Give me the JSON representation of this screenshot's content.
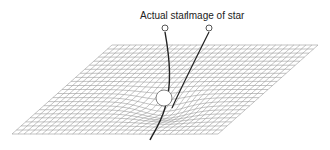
{
  "diagram": {
    "labels": {
      "actual_star": "Actual star",
      "image_of_star": "Image of star"
    },
    "grid": {
      "corners": {
        "tl": [
          112,
          45
        ],
        "tr": [
          318,
          45
        ],
        "br": [
          218,
          134
        ],
        "bl": [
          12,
          134
        ]
      },
      "cols": 34,
      "rows": 22,
      "line_color": "#9a9a9a"
    },
    "mass": {
      "cx": 164,
      "cy": 98,
      "r": 8
    },
    "actual_star": {
      "cx": 165,
      "cy": 28
    },
    "image_star": {
      "cx": 209,
      "cy": 28
    },
    "colors": {
      "ray": "#222222",
      "star_stroke": "#555555"
    }
  }
}
